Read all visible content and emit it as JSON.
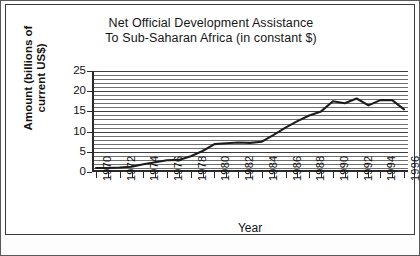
{
  "figure": {
    "background": "#ffffff",
    "border_color": "#3b3b3b",
    "ink_color": "#2a2a2a"
  },
  "chart_data": {
    "type": "line",
    "title": "Net Official Development Assistance To Sub-Saharan Africa (in constant $)",
    "title_line1": "Net Official Development Assistance",
    "title_line2": "To Sub-Saharan Africa (in constant $)",
    "xlabel": "Year",
    "ylabel": "Amount (billions of current US$)",
    "ylabel_line1": "Amount (billions of",
    "ylabel_line2": "current US$)",
    "xlim": [
      1970,
      1996
    ],
    "ylim": [
      0,
      25
    ],
    "ytick_labels": [
      "0",
      "5",
      "10",
      "15",
      "20",
      "25"
    ],
    "ytick_values": [
      0,
      5,
      10,
      15,
      20,
      25
    ],
    "grid": "horizontal gridlines every 1 unit",
    "grid_step": 1,
    "legend": "none",
    "xtick_values": [
      1970,
      1971,
      1972,
      1973,
      1974,
      1975,
      1976,
      1977,
      1978,
      1979,
      1980,
      1981,
      1982,
      1983,
      1984,
      1985,
      1986,
      1987,
      1988,
      1989,
      1990,
      1991,
      1992,
      1993,
      1994,
      1995,
      1996
    ],
    "xtick_labels": [
      "1970",
      "",
      "1972",
      "",
      "1974",
      "",
      "1976",
      "",
      "1978",
      "",
      "1980",
      "",
      "1982",
      "",
      "1984",
      "",
      "1986",
      "",
      "1988",
      "",
      "1990",
      "",
      "1992",
      "",
      "1994",
      "",
      "1996"
    ],
    "x": [
      1970,
      1971,
      1972,
      1973,
      1974,
      1975,
      1976,
      1977,
      1978,
      1979,
      1980,
      1981,
      1982,
      1983,
      1984,
      1985,
      1986,
      1987,
      1988,
      1989,
      1990,
      1991,
      1992,
      1993,
      1994,
      1995,
      1996
    ],
    "values": [
      1.0,
      1.0,
      1.1,
      1.3,
      1.9,
      2.4,
      2.9,
      3.0,
      3.9,
      5.2,
      6.9,
      7.1,
      7.3,
      7.2,
      7.5,
      9.2,
      11.0,
      12.6,
      14.0,
      15.0,
      17.5,
      17.0,
      18.2,
      16.5,
      17.8,
      17.8,
      15.5
    ],
    "series_name": "Net ODA to Sub-Saharan Africa",
    "line_color": "#1c1c1c"
  }
}
